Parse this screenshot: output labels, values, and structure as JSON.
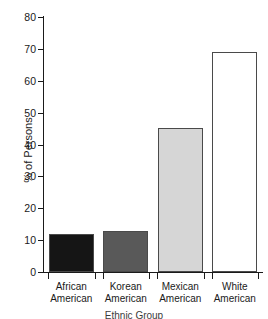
{
  "chart_data": {
    "type": "bar",
    "title": "",
    "subtitle": "",
    "xlabel": "Ethnic Group",
    "ylabel": "% of Persons",
    "categories": [
      "African American",
      "Korean American",
      "Mexican American",
      "White American"
    ],
    "category_lines": [
      [
        "African",
        "American"
      ],
      [
        "Korean",
        "American"
      ],
      [
        "Mexican",
        "American"
      ],
      [
        "White",
        "American"
      ]
    ],
    "values": [
      12,
      13,
      45.3,
      69
    ],
    "value_labels": [
      "12",
      "13",
      "45.3",
      "69"
    ],
    "ylim": [
      0,
      80
    ],
    "yticks": [
      0,
      10,
      20,
      30,
      40,
      50,
      60,
      70,
      80
    ],
    "ytick_labels": [
      "0",
      "10",
      "20",
      "30",
      "40",
      "50",
      "60",
      "70",
      "80"
    ],
    "grid": false,
    "legend": "none",
    "bar_colors": [
      "#151515",
      "#595959",
      "#d6d6d6",
      "#ffffff"
    ],
    "bar_edge_color": "#4a4a4a",
    "axis_color": "#1a1a1a",
    "background_color": "#ffffff"
  },
  "caption": {
    "text": "Ethnic Group"
  }
}
